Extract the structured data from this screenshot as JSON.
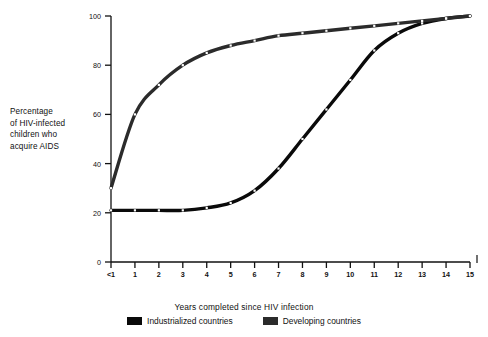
{
  "chart_data": {
    "type": "line",
    "title": "",
    "xlabel": "Years completed since HIV infection",
    "ylabel": "Percentage of HIV-infected children who acquire AIDS",
    "ylabel_lines": [
      "Percentage",
      "of HIV-infected",
      "children who",
      "acquire AIDS"
    ],
    "grid": false,
    "legend_position": "bottom",
    "xlim": [
      0,
      15
    ],
    "ylim": [
      0,
      100
    ],
    "yticks": [
      0,
      20,
      40,
      60,
      80,
      100
    ],
    "ytick_labels": [
      "0",
      "20",
      "40",
      "60",
      "80",
      "100"
    ],
    "x": [
      0,
      1,
      2,
      3,
      4,
      5,
      6,
      7,
      8,
      9,
      10,
      11,
      12,
      13,
      14,
      15
    ],
    "xtick_labels": [
      "<1",
      "1",
      "2",
      "3",
      "4",
      "5",
      "6",
      "7",
      "8",
      "9",
      "10",
      "11",
      "12",
      "13",
      "14",
      "15"
    ],
    "series": [
      {
        "name": "Industrialized countries",
        "color": "#0a0a0a",
        "values": [
          21,
          21,
          21,
          21,
          22,
          24,
          29,
          38,
          50,
          62,
          74,
          86,
          93,
          97,
          99,
          100
        ]
      },
      {
        "name": "Developing countries",
        "color": "#2b2b2b",
        "values": [
          30,
          60,
          72,
          80,
          85,
          88,
          90,
          92,
          93,
          94,
          95,
          96,
          97,
          98,
          99,
          100
        ]
      }
    ],
    "annotations": [
      {
        "name": "right-edge-mark",
        "text": "I"
      }
    ]
  },
  "legend": {
    "items": [
      {
        "label": "Industrialized countries",
        "color": "#0a0a0a"
      },
      {
        "label": "Developing countries",
        "color": "#2b2b2b"
      }
    ]
  }
}
